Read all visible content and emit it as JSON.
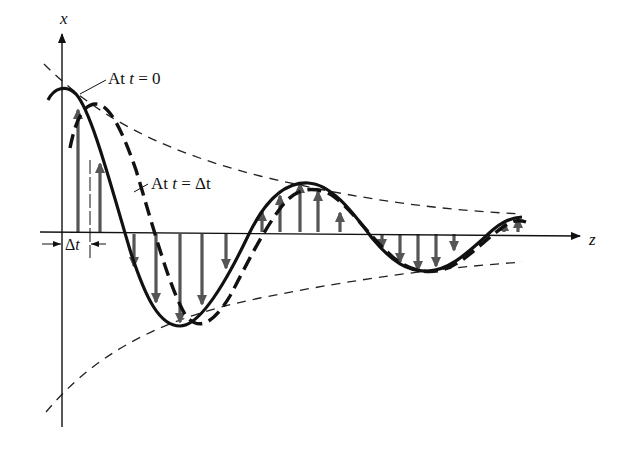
{
  "diagram": {
    "axes": {
      "vertical_label": "x",
      "horizontal_label": "z"
    },
    "annotations": {
      "t0_prefix": "At ",
      "t0_var": "t",
      "t0_suffix": " = 0",
      "tdt_prefix": "At ",
      "tdt_var": "t",
      "tdt_suffix": " = Δt",
      "delta_t_symbol": "Δ",
      "delta_t_var": "t"
    },
    "curves": [
      {
        "name": "wave-at-t0",
        "style": "solid"
      },
      {
        "name": "wave-at-t-delta",
        "style": "dashed"
      },
      {
        "name": "upper-envelope",
        "style": "thin-dashed"
      },
      {
        "name": "lower-envelope",
        "style": "thin-dashed"
      }
    ],
    "colors": {
      "ink": "#111111",
      "arrow": "#555555",
      "background": "#ffffff"
    }
  }
}
